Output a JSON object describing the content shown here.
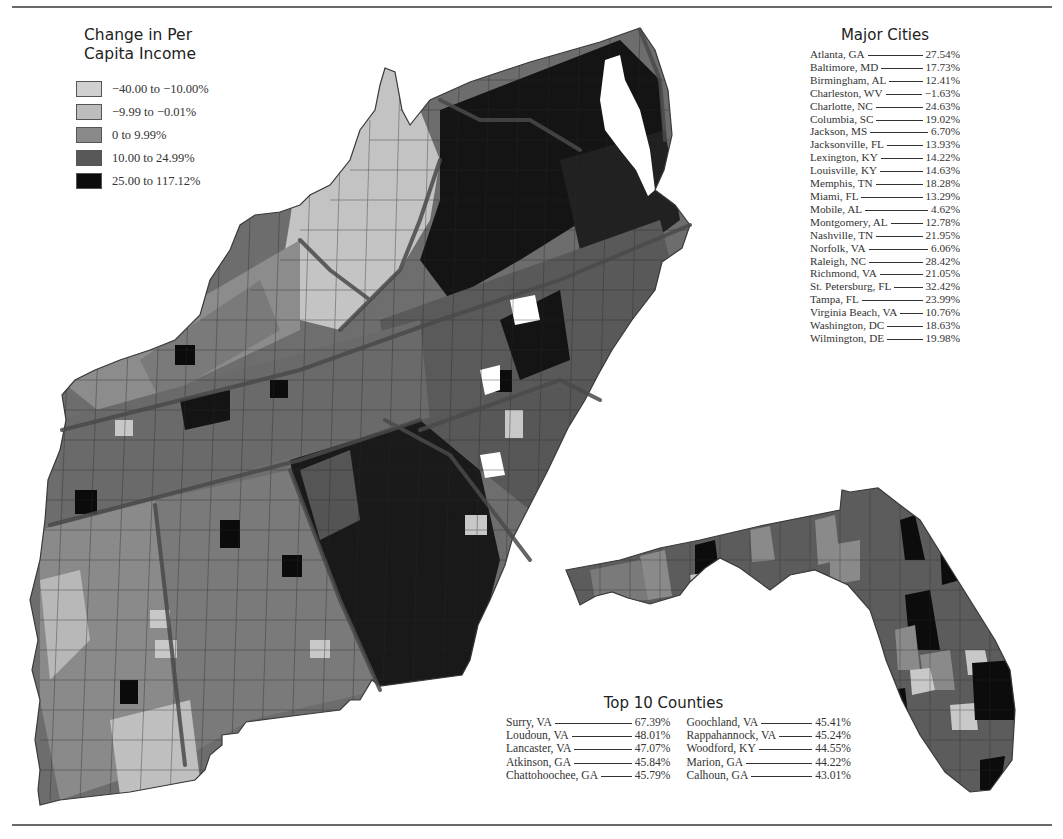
{
  "legend": {
    "title_line1": "Change in Per",
    "title_line2": "Capita Income",
    "items": [
      {
        "label": "−40.00 to −10.00%",
        "color": "#d0d0d0"
      },
      {
        "label": "−9.99 to −0.01%",
        "color": "#bdbdbd"
      },
      {
        "label": "0 to 9.99%",
        "color": "#8a8a8a"
      },
      {
        "label": "10.00 to 24.99%",
        "color": "#585858"
      },
      {
        "label": "25.00 to 117.12%",
        "color": "#0c0c0c"
      }
    ]
  },
  "major_cities": {
    "title": "Major Cities",
    "items": [
      {
        "name": "Atlanta, GA",
        "value": "27.54%"
      },
      {
        "name": "Baltimore, MD",
        "value": "17.73%"
      },
      {
        "name": "Birmingham, AL",
        "value": "12.41%"
      },
      {
        "name": "Charleston, WV",
        "value": "−1.63%"
      },
      {
        "name": "Charlotte, NC",
        "value": "24.63%"
      },
      {
        "name": "Columbia, SC",
        "value": "19.02%"
      },
      {
        "name": "Jackson, MS",
        "value": "6.70%"
      },
      {
        "name": "Jacksonville, FL",
        "value": "13.93%"
      },
      {
        "name": "Lexington, KY",
        "value": "14.22%"
      },
      {
        "name": "Louisville, KY",
        "value": "14.63%"
      },
      {
        "name": "Memphis, TN",
        "value": "18.28%"
      },
      {
        "name": "Miami, FL",
        "value": "13.29%"
      },
      {
        "name": "Mobile, AL",
        "value": "4.62%"
      },
      {
        "name": "Montgomery, AL",
        "value": "12.78%"
      },
      {
        "name": "Nashville, TN",
        "value": "21.95%"
      },
      {
        "name": "Norfolk, VA",
        "value": "6.06%"
      },
      {
        "name": "Raleigh, NC",
        "value": "28.42%"
      },
      {
        "name": "Richmond, VA",
        "value": "21.05%"
      },
      {
        "name": "St. Petersburg, FL",
        "value": "32.42%"
      },
      {
        "name": "Tampa, FL",
        "value": "23.99%"
      },
      {
        "name": "Virginia Beach, VA",
        "value": "10.76%"
      },
      {
        "name": "Washington, DC",
        "value": "18.63%"
      },
      {
        "name": "Wilmington, DE",
        "value": "19.98%"
      }
    ]
  },
  "top_counties": {
    "title": "Top 10 Counties",
    "left": [
      {
        "name": "Surry, VA",
        "value": "67.39%"
      },
      {
        "name": "Loudoun, VA",
        "value": "48.01%"
      },
      {
        "name": "Lancaster, VA",
        "value": "47.07%"
      },
      {
        "name": "Atkinson, GA",
        "value": "45.84%"
      },
      {
        "name": "Chattohoochee, GA",
        "value": "45.79%"
      }
    ],
    "right": [
      {
        "name": "Goochland, VA",
        "value": "45.41%"
      },
      {
        "name": "Rappahannock, VA",
        "value": "45.24%"
      },
      {
        "name": "Woodford, KY",
        "value": "44.55%"
      },
      {
        "name": "Marion, GA",
        "value": "44.22%"
      },
      {
        "name": "Calhoun, GA",
        "value": "43.01%"
      }
    ]
  },
  "map": {
    "colors": {
      "very_light": "#d0d0d0",
      "light": "#bdbdbd",
      "mid": "#8a8a8a",
      "dark": "#585858",
      "black": "#0c0c0c",
      "state_border": "#4a4a4a",
      "county_border": "#2a2a2a"
    }
  }
}
